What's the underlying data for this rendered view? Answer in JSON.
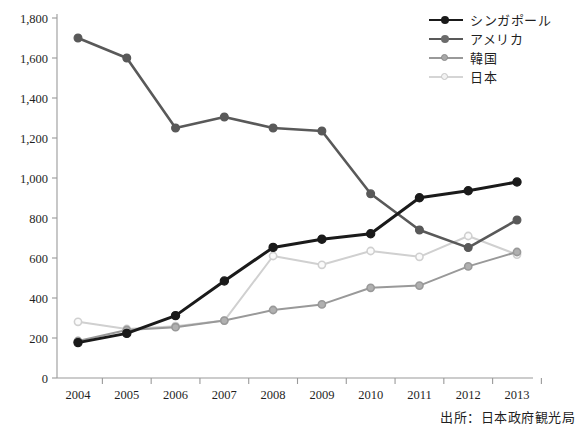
{
  "chart_data": {
    "type": "line",
    "title": "",
    "xlabel": "",
    "ylabel": "",
    "categories": [
      "2004",
      "2005",
      "2006",
      "2007",
      "2008",
      "2009",
      "2010",
      "2011",
      "2012",
      "2013"
    ],
    "ylim": [
      0,
      1800
    ],
    "ytick_labels": [
      "0",
      "200",
      "400",
      "600",
      "800",
      "1,000",
      "1,200",
      "1,400",
      "1,600",
      "1,800"
    ],
    "ytick_values": [
      0,
      200,
      400,
      600,
      800,
      1000,
      1200,
      1400,
      1600,
      1800
    ],
    "grid": false,
    "legend_position": "top-right",
    "series": [
      {
        "name": "シンガポール",
        "color": "#1a1a1a",
        "values": [
          177,
          223,
          312,
          485,
          653,
          694,
          721,
          901,
          936,
          980
        ]
      },
      {
        "name": "アメリカ",
        "color": "#595959",
        "values": [
          1700,
          1600,
          1250,
          1305,
          1250,
          1235,
          921,
          740,
          652,
          790
        ]
      },
      {
        "name": "韓国",
        "color": "#999999",
        "values": [
          185,
          240,
          254,
          287,
          340,
          368,
          451,
          462,
          558,
          630
        ]
      },
      {
        "name": "日本",
        "color": "#d0d0d0",
        "values": [
          281,
          245,
          259,
          287,
          610,
          566,
          635,
          606,
          710,
          617
        ]
      }
    ],
    "source_note": "出所：日本政府観光局"
  },
  "legend": {
    "items": [
      {
        "label": "シンガポール"
      },
      {
        "label": "アメリカ"
      },
      {
        "label": "韓国"
      },
      {
        "label": "日本"
      }
    ]
  },
  "footer": {
    "source": "出所：日本政府観光局"
  }
}
